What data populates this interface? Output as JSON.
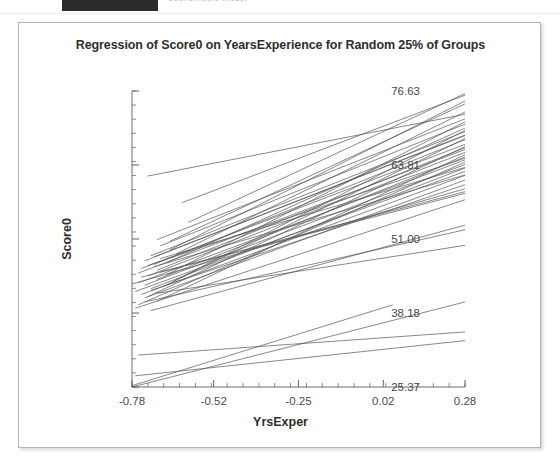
{
  "top_strip": {
    "redacted_label": "",
    "ghost_text": "econometric model"
  },
  "figure": {
    "title": "Regression of Score0 on YearsExperience for Random 25% of Groups",
    "xlabel": "YrsExper",
    "ylabel": "Score0"
  },
  "chart_data": {
    "type": "line",
    "title": "Regression of Score0 on YearsExperience for Random 25% of Groups",
    "subtitle": "",
    "xlabel": "YrsExper",
    "ylabel": "Score0",
    "xlim": [
      -0.78,
      0.28
    ],
    "ylim": [
      25.37,
      76.63
    ],
    "xticks": [
      -0.78,
      -0.52,
      -0.25,
      0.02,
      0.28
    ],
    "xticklabels": [
      "-0.78",
      "-0.52",
      "-0.25",
      "0.02",
      "0.28"
    ],
    "yticks": [
      25.37,
      38.18,
      51.0,
      63.81,
      76.63
    ],
    "yticklabels": [
      "25.37",
      "38.18",
      "51.00",
      "63.81",
      "76.63"
    ],
    "x_minor_tick_count": 21,
    "y_minor_tick_count": 21,
    "grid": false,
    "legend": null,
    "legend_position": "none",
    "line_color": "#555555",
    "line_width": 0.7,
    "series": [
      {
        "name": "g01",
        "x": [
          -0.73,
          0.28
        ],
        "y": [
          61.9,
          72.6
        ]
      },
      {
        "name": "g02",
        "x": [
          -0.62,
          0.28
        ],
        "y": [
          57.3,
          75.9
        ]
      },
      {
        "name": "g03",
        "x": [
          -0.6,
          0.28
        ],
        "y": [
          53.9,
          76.2
        ]
      },
      {
        "name": "g04",
        "x": [
          -0.66,
          0.28
        ],
        "y": [
          50.6,
          74.4
        ]
      },
      {
        "name": "g05",
        "x": [
          -0.7,
          0.28
        ],
        "y": [
          50.9,
          71.8
        ]
      },
      {
        "name": "g06",
        "x": [
          -0.69,
          0.28
        ],
        "y": [
          49.8,
          70.9
        ]
      },
      {
        "name": "g07",
        "x": [
          -0.72,
          0.28
        ],
        "y": [
          48.1,
          69.6
        ]
      },
      {
        "name": "g08",
        "x": [
          -0.74,
          0.28
        ],
        "y": [
          47.2,
          69.0
        ]
      },
      {
        "name": "g09",
        "x": [
          -0.71,
          0.28
        ],
        "y": [
          46.6,
          68.2
        ]
      },
      {
        "name": "g10",
        "x": [
          -0.75,
          0.28
        ],
        "y": [
          45.9,
          67.4
        ]
      },
      {
        "name": "g11",
        "x": [
          -0.76,
          0.28
        ],
        "y": [
          45.1,
          66.5
        ]
      },
      {
        "name": "g12",
        "x": [
          -0.73,
          0.28
        ],
        "y": [
          44.6,
          66.0
        ]
      },
      {
        "name": "g13",
        "x": [
          -0.7,
          0.28
        ],
        "y": [
          44.0,
          65.2
        ]
      },
      {
        "name": "g14",
        "x": [
          -0.76,
          0.28
        ],
        "y": [
          43.4,
          64.7
        ]
      },
      {
        "name": "g15",
        "x": [
          -0.74,
          0.28
        ],
        "y": [
          43.0,
          63.9
        ]
      },
      {
        "name": "g16",
        "x": [
          -0.72,
          0.28
        ],
        "y": [
          42.4,
          63.3
        ]
      },
      {
        "name": "g17",
        "x": [
          -0.77,
          0.28
        ],
        "y": [
          41.9,
          62.7
        ]
      },
      {
        "name": "g18",
        "x": [
          -0.75,
          0.28
        ],
        "y": [
          41.4,
          62.0
        ]
      },
      {
        "name": "g19",
        "x": [
          -0.71,
          0.28
        ],
        "y": [
          46.2,
          62.1
        ]
      },
      {
        "name": "g20",
        "x": [
          -0.69,
          0.28
        ],
        "y": [
          47.6,
          63.4
        ]
      },
      {
        "name": "g21",
        "x": [
          -0.67,
          0.28
        ],
        "y": [
          44.8,
          71.3
        ]
      },
      {
        "name": "g22",
        "x": [
          -0.65,
          0.28
        ],
        "y": [
          43.6,
          69.8
        ]
      },
      {
        "name": "g23",
        "x": [
          -0.68,
          0.28
        ],
        "y": [
          42.8,
          68.4
        ]
      },
      {
        "name": "g24",
        "x": [
          -0.73,
          0.28
        ],
        "y": [
          41.0,
          67.0
        ]
      },
      {
        "name": "g25",
        "x": [
          -0.7,
          0.28
        ],
        "y": [
          40.2,
          65.6
        ]
      },
      {
        "name": "g26",
        "x": [
          -0.76,
          0.28
        ],
        "y": [
          39.6,
          64.3
        ]
      },
      {
        "name": "g27",
        "x": [
          -0.74,
          0.28
        ],
        "y": [
          40.8,
          61.2
        ]
      },
      {
        "name": "g28",
        "x": [
          -0.72,
          0.28
        ],
        "y": [
          42.1,
          60.4
        ]
      },
      {
        "name": "g29",
        "x": [
          -0.78,
          0.28
        ],
        "y": [
          43.2,
          59.7
        ]
      },
      {
        "name": "g30",
        "x": [
          -0.75,
          0.28
        ],
        "y": [
          44.4,
          58.9
        ]
      },
      {
        "name": "g31",
        "x": [
          -0.7,
          0.28
        ],
        "y": [
          45.6,
          66.8
        ]
      },
      {
        "name": "g32",
        "x": [
          -0.67,
          0.28
        ],
        "y": [
          46.9,
          70.2
        ]
      },
      {
        "name": "g33",
        "x": [
          -0.64,
          0.28
        ],
        "y": [
          48.4,
          73.0
        ]
      },
      {
        "name": "g34",
        "x": [
          -0.66,
          0.28
        ],
        "y": [
          49.1,
          74.9
        ]
      },
      {
        "name": "g35",
        "x": [
          -0.71,
          0.28
        ],
        "y": [
          47.9,
          68.9
        ]
      },
      {
        "name": "g36",
        "x": [
          -0.73,
          0.28
        ],
        "y": [
          46.4,
          65.0
        ]
      },
      {
        "name": "g37",
        "x": [
          -0.69,
          0.28
        ],
        "y": [
          45.3,
          59.2
        ]
      },
      {
        "name": "g38",
        "x": [
          -0.77,
          0.28
        ],
        "y": [
          39.0,
          57.8
        ]
      },
      {
        "name": "g39",
        "x": [
          -0.72,
          0.28
        ],
        "y": [
          38.6,
          53.4
        ]
      },
      {
        "name": "g40",
        "x": [
          -0.74,
          0.28
        ],
        "y": [
          40.1,
          52.6
        ]
      },
      {
        "name": "g41",
        "x": [
          -0.7,
          0.28
        ],
        "y": [
          41.6,
          49.9
        ]
      },
      {
        "name": "g42",
        "x": [
          -0.78,
          0.28
        ],
        "y": [
          25.37,
          40.1
        ]
      },
      {
        "name": "g43",
        "x": [
          -0.78,
          0.05
        ],
        "y": [
          25.6,
          39.6
        ]
      },
      {
        "name": "g44",
        "x": [
          -0.76,
          0.28
        ],
        "y": [
          30.9,
          34.9
        ]
      },
      {
        "name": "g45",
        "x": [
          -0.77,
          0.28
        ],
        "y": [
          27.3,
          33.4
        ]
      }
    ]
  }
}
